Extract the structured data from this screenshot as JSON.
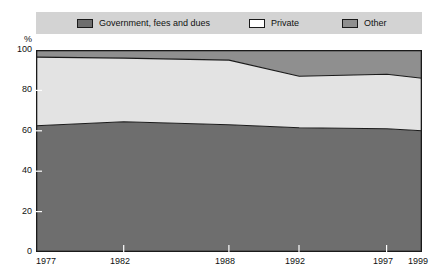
{
  "legend": {
    "background_color": "#d3d3d3",
    "items": [
      {
        "label": "Government, fees and dues",
        "color": "#6e6e6e",
        "icon": "legend-swatch-icon"
      },
      {
        "label": "Private",
        "color": "#ffffff",
        "icon": "legend-swatch-icon"
      },
      {
        "label": "Other",
        "color": "#8f8f8f",
        "icon": "legend-swatch-icon"
      }
    ]
  },
  "axes": {
    "y_unit": "%",
    "y_ticks": [
      "100",
      "80",
      "60",
      "40",
      "20",
      "0"
    ],
    "x_ticks": [
      "1977",
      "1982",
      "1988",
      "1992",
      "1997",
      "1999"
    ]
  },
  "chart_data": {
    "type": "area",
    "title": "",
    "subtitle": "",
    "xlabel": "",
    "ylabel": "%",
    "ylim": [
      0,
      100
    ],
    "xlim": [
      1977,
      1999
    ],
    "stacked": true,
    "grid": false,
    "legend_position": "top",
    "x": [
      1977,
      1982,
      1988,
      1992,
      1997,
      1999
    ],
    "series": [
      {
        "name": "Government, fees and dues",
        "color": "#6e6e6e",
        "values": [
          62.5,
          64.5,
          63.0,
          61.5,
          61.0,
          60.0
        ]
      },
      {
        "name": "Private",
        "color": "#e3e3e3",
        "values": [
          34.0,
          31.5,
          32.0,
          25.5,
          27.0,
          26.0
        ]
      },
      {
        "name": "Other",
        "color": "#8f8f8f",
        "values": [
          3.5,
          4.0,
          5.0,
          13.0,
          12.0,
          14.0
        ]
      }
    ],
    "cumulative_upper_bounds": {
      "government": [
        62.5,
        64.5,
        63.0,
        61.5,
        61.0,
        60.0
      ],
      "government_plus_private": [
        96.5,
        96.0,
        95.0,
        87.0,
        88.0,
        86.0
      ],
      "total": [
        100,
        100,
        100,
        100,
        100,
        100
      ]
    }
  }
}
